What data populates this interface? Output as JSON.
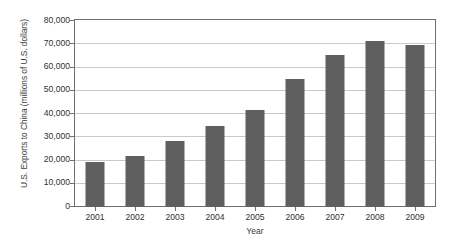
{
  "chart_data": {
    "type": "bar",
    "title": "",
    "xlabel": "Year",
    "ylabel": "U.S. Exports to China (millions of U.S. dollars)",
    "categories": [
      "2001",
      "2002",
      "2003",
      "2004",
      "2005",
      "2006",
      "2007",
      "2008",
      "2009"
    ],
    "values": [
      19200,
      22100,
      28400,
      34700,
      41800,
      55200,
      65200,
      71500,
      69600
    ],
    "ylim": [
      0,
      80000
    ],
    "ytick_values": [
      0,
      10000,
      20000,
      30000,
      40000,
      50000,
      60000,
      70000,
      80000
    ],
    "ytick_labels": [
      "0",
      "10,000",
      "20,000",
      "30,000",
      "40,000",
      "50,000",
      "60,000",
      "70,000",
      "80,000"
    ],
    "grid": true,
    "legend": false,
    "bar_color": "#5f5f5f",
    "gridline_color": "#c9c9c9",
    "axis_color": "#6f6f6f",
    "background_color": "#ffffff"
  }
}
